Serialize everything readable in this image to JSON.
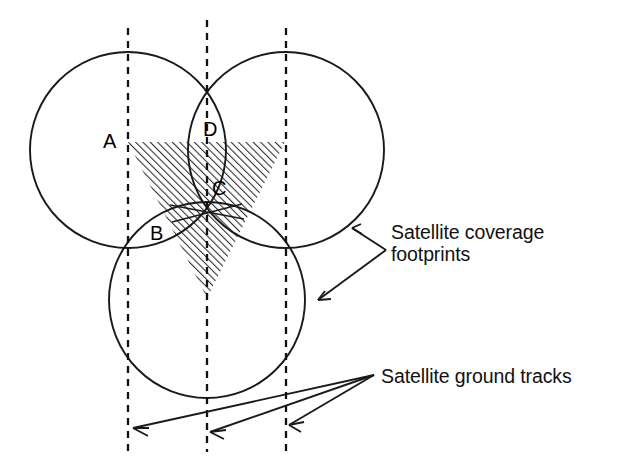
{
  "diagram": {
    "background_color": "#ffffff",
    "line_color": "#1a1a1a",
    "hatch_color": "#2b2b2b",
    "width": 629,
    "height": 469
  },
  "point_labels": [
    {
      "id": "A",
      "text": "A",
      "x": 103,
      "y": 148
    },
    {
      "id": "B",
      "text": "B",
      "x": 150,
      "y": 240
    },
    {
      "id": "C",
      "text": "C",
      "x": 212,
      "y": 195
    },
    {
      "id": "D",
      "text": "D",
      "x": 203,
      "y": 136
    }
  ],
  "callouts": {
    "footprints": {
      "text": "Satellite coverage\nfootprints",
      "arrow_count": 2
    },
    "ground_tracks": {
      "text": "Satellite ground tracks",
      "arrow_count": 3
    }
  },
  "footprint_circles": [
    {
      "name": "upper-left-footprint",
      "cx": 128,
      "cy": 150,
      "r": 98
    },
    {
      "name": "upper-right-footprint",
      "cx": 286,
      "cy": 150,
      "r": 98
    },
    {
      "name": "lower-center-footprint",
      "cx": 207,
      "cy": 300,
      "r": 98
    }
  ],
  "ground_tracks": [
    {
      "name": "ground-track-left",
      "x": 128,
      "y1": 28,
      "y2": 452
    },
    {
      "name": "ground-track-center",
      "x": 207,
      "y1": 20,
      "y2": 452
    },
    {
      "name": "ground-track-right",
      "x": 286,
      "y1": 28,
      "y2": 452
    }
  ],
  "coverage_region": {
    "name": "triple-coverage-triangle",
    "points": "128,142 285,142 207,298",
    "fill": "hatched"
  }
}
